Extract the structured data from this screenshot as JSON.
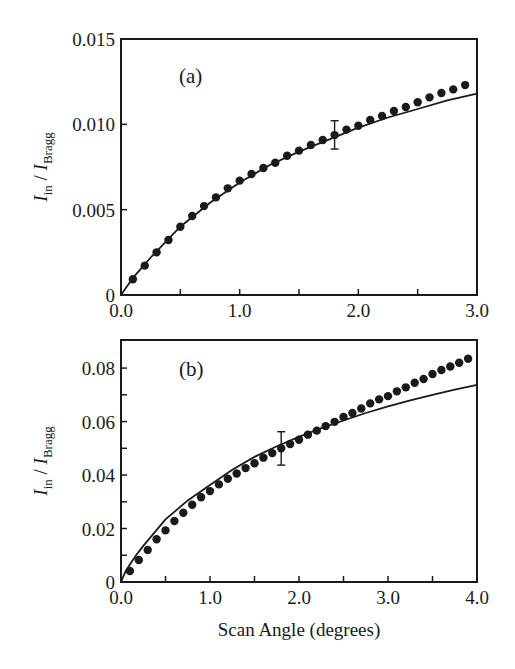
{
  "figure": {
    "xlabel": "Scan Angle  (degrees)",
    "colors": {
      "ink": "#1a1a1a",
      "background": "#ffffff"
    }
  },
  "chart_data": [
    {
      "type": "scatter",
      "panel_label": "(a)",
      "title": "",
      "xlabel": "",
      "ylabel": "I_in / I_Bragg",
      "ylabel_parts": {
        "main1": "I",
        "sub1": "in",
        "sep": " / ",
        "main2": "I",
        "sub2": "Bragg"
      },
      "xlim": [
        0,
        3.0
      ],
      "ylim": [
        0,
        0.015
      ],
      "xticks": [
        0,
        0.5,
        1.0,
        1.5,
        2.0,
        2.5,
        3.0
      ],
      "xtick_labels": [
        "0.0",
        "",
        "1.0",
        "",
        "2.0",
        "",
        "3.0"
      ],
      "yticks": [
        0,
        0.005,
        0.01,
        0.015
      ],
      "ytick_labels": [
        "0",
        "0.005",
        "0.010",
        "0.015"
      ],
      "grid": false,
      "legend": null,
      "series": [
        {
          "name": "data",
          "style": "dots",
          "x": [
            0.1,
            0.2,
            0.3,
            0.4,
            0.5,
            0.6,
            0.7,
            0.8,
            0.9,
            1.0,
            1.1,
            1.2,
            1.3,
            1.4,
            1.5,
            1.6,
            1.7,
            1.8,
            1.9,
            2.0,
            2.1,
            2.2,
            2.3,
            2.4,
            2.5,
            2.6,
            2.7,
            2.8,
            2.9
          ],
          "y": [
            0.00092,
            0.00172,
            0.0025,
            0.00322,
            0.004,
            0.00463,
            0.00521,
            0.00572,
            0.00625,
            0.0067,
            0.00709,
            0.00744,
            0.00775,
            0.00816,
            0.00846,
            0.00879,
            0.00908,
            0.00937,
            0.00969,
            0.00992,
            0.01025,
            0.01049,
            0.01078,
            0.01102,
            0.01129,
            0.01158,
            0.01184,
            0.01205,
            0.0123
          ]
        },
        {
          "name": "fit",
          "style": "line",
          "x": [
            0,
            0.05,
            0.1,
            0.25,
            0.5,
            0.75,
            1.0,
            1.25,
            1.5,
            1.75,
            2.0,
            2.25,
            2.5,
            2.75,
            3.0
          ],
          "y": [
            0,
            0.0005,
            0.001,
            0.0022,
            0.004,
            0.0054,
            0.0066,
            0.0076,
            0.0084,
            0.0091,
            0.0098,
            0.0104,
            0.0109,
            0.0114,
            0.0118
          ]
        }
      ],
      "error_bar": {
        "x": 1.8,
        "y": 0.00937,
        "ymin": 0.00855,
        "ymax": 0.01021
      }
    },
    {
      "type": "scatter",
      "panel_label": "(b)",
      "title": "",
      "xlabel": "Scan Angle  (degrees)",
      "ylabel": "I_in / I_Bragg",
      "ylabel_parts": {
        "main1": "I",
        "sub1": "in",
        "sep": " / ",
        "main2": "I",
        "sub2": "Bragg"
      },
      "xlim": [
        0,
        4.0
      ],
      "ylim": [
        0,
        0.0905
      ],
      "xticks": [
        0,
        0.5,
        1.0,
        1.5,
        2.0,
        2.5,
        3.0,
        3.5,
        4.0
      ],
      "xtick_labels": [
        "0.0",
        "",
        "1.0",
        "",
        "2.0",
        "",
        "3.0",
        "",
        "4.0"
      ],
      "yticks": [
        0,
        0.01,
        0.02,
        0.03,
        0.04,
        0.05,
        0.06,
        0.07,
        0.08
      ],
      "ytick_labels": [
        "0",
        "",
        "0.02",
        "",
        "0.04",
        "",
        "0.06",
        "",
        "0.08"
      ],
      "grid": false,
      "legend": null,
      "series": [
        {
          "name": "data",
          "style": "dots",
          "x": [
            0.1,
            0.2,
            0.3,
            0.4,
            0.5,
            0.6,
            0.7,
            0.8,
            0.9,
            1.0,
            1.1,
            1.2,
            1.3,
            1.4,
            1.5,
            1.6,
            1.7,
            1.8,
            1.9,
            2.0,
            2.1,
            2.2,
            2.3,
            2.4,
            2.5,
            2.6,
            2.7,
            2.8,
            2.9,
            3.0,
            3.1,
            3.2,
            3.3,
            3.4,
            3.5,
            3.6,
            3.7,
            3.8,
            3.9
          ],
          "y": [
            0.0041,
            0.0082,
            0.012,
            0.016,
            0.0193,
            0.0228,
            0.0259,
            0.0289,
            0.0317,
            0.034,
            0.0365,
            0.0386,
            0.0406,
            0.0426,
            0.0444,
            0.0465,
            0.0482,
            0.05,
            0.0516,
            0.0532,
            0.0551,
            0.0566,
            0.0583,
            0.0599,
            0.0617,
            0.0632,
            0.0649,
            0.0668,
            0.0683,
            0.0695,
            0.0713,
            0.0728,
            0.0745,
            0.0759,
            0.0778,
            0.0793,
            0.0806,
            0.082,
            0.0835
          ]
        },
        {
          "name": "fit",
          "style": "line",
          "x": [
            0,
            0.05,
            0.1,
            0.17,
            0.25,
            0.5,
            0.75,
            1.0,
            1.25,
            1.5,
            1.75,
            2.0,
            2.25,
            2.5,
            2.75,
            3.0,
            3.25,
            3.5,
            3.75,
            4.0
          ],
          "y": [
            0,
            0.004,
            0.0065,
            0.01,
            0.0135,
            0.0234,
            0.0305,
            0.0363,
            0.042,
            0.0468,
            0.0508,
            0.0543,
            0.0575,
            0.0604,
            0.0632,
            0.0657,
            0.0679,
            0.07,
            0.0719,
            0.0737
          ]
        }
      ],
      "error_bar": {
        "x": 1.8,
        "y": 0.05,
        "ymin": 0.0437,
        "ymax": 0.0562
      }
    }
  ]
}
